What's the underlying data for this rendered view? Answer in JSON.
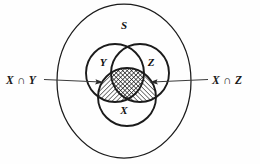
{
  "diagram": {
    "type": "venn-diagram",
    "universal_set_label": "S",
    "sets": [
      {
        "id": "Y",
        "label": "Y",
        "position": "upper-left",
        "cx": 115,
        "cy": 73,
        "r": 29
      },
      {
        "id": "Z",
        "label": "Z",
        "position": "upper-right",
        "cx": 140,
        "cy": 73,
        "r": 29
      },
      {
        "id": "X",
        "label": "X",
        "position": "bottom-center",
        "cx": 127,
        "cy": 97,
        "r": 29
      }
    ],
    "set_label_positions": [
      {
        "id": "Y",
        "x": 103,
        "y": 66
      },
      {
        "id": "Z",
        "x": 151,
        "y": 66
      },
      {
        "id": "X",
        "x": 124,
        "y": 114
      }
    ],
    "universal_label_position": {
      "x": 124,
      "y": 29
    },
    "outer_boundary": {
      "cx": 124,
      "cy": 81,
      "rx": 67,
      "ry": 77
    },
    "shaded_regions": [
      {
        "id": "X_AND_Y",
        "description": "intersection of X and Y",
        "hatch": "diagonal-right"
      },
      {
        "id": "X_AND_Z",
        "description": "intersection of X and Z",
        "hatch": "diagonal-left"
      },
      {
        "id": "X_AND_Y_AND_Z",
        "description": "triple intersection",
        "hatch": "cross-hatch"
      }
    ],
    "annotations": [
      {
        "id": "left-annotation",
        "label": "X ∩ Y",
        "label_x": 6,
        "label_y": 84,
        "line_from": {
          "x": 44,
          "y": 80
        },
        "line_to": {
          "x": 103,
          "y": 82
        },
        "arrow_direction": "right"
      },
      {
        "id": "right-annotation",
        "label": "X ∩ Z",
        "label_x": 212,
        "label_y": 84,
        "line_from": {
          "x": 208,
          "y": 80
        },
        "line_to": {
          "x": 150,
          "y": 82
        },
        "arrow_direction": "left"
      }
    ],
    "colors": {
      "background": "#ffffff",
      "stroke": "#1b1b1b",
      "annotation_stroke": "#3b3b3b",
      "text": "#111111"
    }
  }
}
